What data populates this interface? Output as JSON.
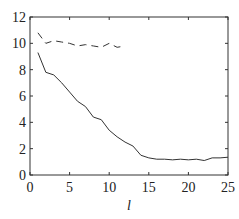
{
  "chart_data": {
    "type": "line",
    "title": "",
    "xlabel": "l",
    "ylabel": "",
    "xlim": [
      0,
      25
    ],
    "ylim": [
      0,
      12
    ],
    "xticks": [
      0,
      5,
      10,
      15,
      20,
      25
    ],
    "yticks": [
      0,
      2,
      4,
      6,
      8,
      10,
      12
    ],
    "grid": false,
    "series": [
      {
        "name": "dashed",
        "style": "dashed",
        "x": [
          1,
          2,
          3,
          4,
          5,
          6,
          7,
          8,
          9,
          10,
          11,
          12
        ],
        "values": [
          10.8,
          10.0,
          10.2,
          10.1,
          10.0,
          9.8,
          9.9,
          9.8,
          9.7,
          10.0,
          9.7,
          9.8
        ]
      },
      {
        "name": "solid",
        "style": "solid",
        "x": [
          1,
          2,
          3,
          4,
          5,
          6,
          7,
          8,
          9,
          10,
          11,
          12,
          13,
          14,
          15,
          16,
          17,
          18,
          19,
          20,
          21,
          22,
          23,
          24,
          25
        ],
        "values": [
          9.3,
          7.8,
          7.6,
          7.0,
          6.3,
          5.6,
          5.2,
          4.4,
          4.2,
          3.4,
          2.9,
          2.5,
          2.2,
          1.5,
          1.3,
          1.2,
          1.2,
          1.15,
          1.2,
          1.15,
          1.2,
          1.1,
          1.3,
          1.3,
          1.35
        ]
      }
    ]
  }
}
